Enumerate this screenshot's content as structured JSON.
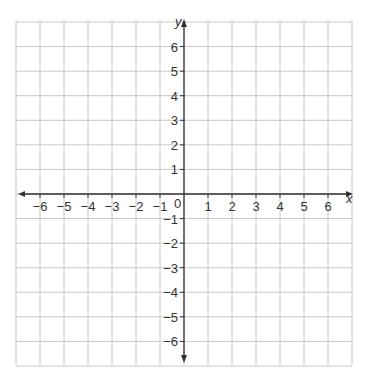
{
  "chart_data": {
    "type": "coordinate_grid",
    "title": "",
    "xlabel": "x",
    "ylabel": "y",
    "xlim": [
      -7,
      7
    ],
    "ylim": [
      -7,
      7
    ],
    "grid": true,
    "x_ticks": [
      -6,
      -5,
      -4,
      -3,
      -2,
      -1,
      1,
      2,
      3,
      4,
      5,
      6
    ],
    "y_ticks": [
      -6,
      -5,
      -4,
      -3,
      -2,
      -1,
      1,
      2,
      3,
      4,
      5,
      6
    ],
    "origin_label": "0",
    "points": []
  },
  "colors": {
    "grid": "#c8c8c8",
    "axis": "#333333",
    "text": "#333333"
  }
}
